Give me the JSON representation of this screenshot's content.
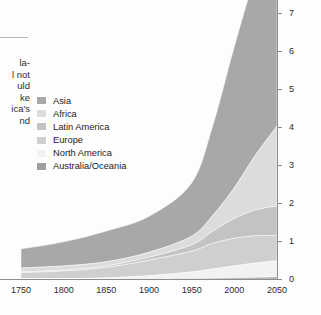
{
  "page": {
    "background": "#fdfdfd",
    "body_text_fragments": [
      "la-",
      "l not",
      "uld",
      "ke",
      "ica's",
      "nd"
    ]
  },
  "legend": {
    "items": [
      {
        "label": "Asia",
        "color": "#a8a8a8"
      },
      {
        "label": "Africa",
        "color": "#dcdcdc"
      },
      {
        "label": "Latin America",
        "color": "#c3c3c3"
      },
      {
        "label": "Europe",
        "color": "#cfcfcf"
      },
      {
        "label": "North America",
        "color": "#f2f2f2"
      },
      {
        "label": "Australia/Oceania",
        "color": "#9f9f9f"
      }
    ]
  },
  "axes": {
    "y_title": "Billions of people",
    "y_ticks": [
      "0",
      "1",
      "2",
      "3",
      "4",
      "5",
      "6",
      "7"
    ],
    "x_ticks": [
      "1750",
      "1800",
      "1850",
      "1900",
      "1950",
      "2000",
      "2050"
    ]
  },
  "chart_data": {
    "type": "area",
    "stacked": true,
    "title": "",
    "xlabel": "",
    "ylabel": "Billions of people",
    "xlim": [
      1750,
      2050
    ],
    "ylim": [
      0,
      7.6
    ],
    "grid": false,
    "legend_position": "inside-top-left",
    "x": [
      1750,
      1800,
      1850,
      1900,
      1950,
      1975,
      2000,
      2025,
      2050
    ],
    "series": [
      {
        "name": "Australia/Oceania",
        "color": "#9f9f9f",
        "values": [
          0.002,
          0.002,
          0.002,
          0.006,
          0.013,
          0.021,
          0.031,
          0.042,
          0.052
        ]
      },
      {
        "name": "North America",
        "color": "#f2f2f2",
        "values": [
          0.002,
          0.007,
          0.026,
          0.082,
          0.172,
          0.243,
          0.314,
          0.38,
          0.43
        ]
      },
      {
        "name": "Europe",
        "color": "#cfcfcf",
        "values": [
          0.163,
          0.203,
          0.276,
          0.408,
          0.547,
          0.676,
          0.727,
          0.715,
          0.66
        ]
      },
      {
        "name": "Latin America",
        "color": "#c3c3c3",
        "values": [
          0.016,
          0.024,
          0.038,
          0.074,
          0.167,
          0.322,
          0.521,
          0.68,
          0.78
        ]
      },
      {
        "name": "Africa",
        "color": "#dcdcdc",
        "values": [
          0.106,
          0.107,
          0.111,
          0.133,
          0.227,
          0.416,
          0.811,
          1.45,
          2.1
        ]
      },
      {
        "name": "Asia",
        "color": "#a8a8a8",
        "values": [
          0.502,
          0.635,
          0.809,
          0.947,
          1.402,
          2.379,
          3.714,
          4.72,
          5.27
        ]
      }
    ],
    "stack_totals": [
      0.791,
      0.978,
      1.262,
      1.65,
      2.528,
      4.057,
      6.118,
      7.987,
      9.292
    ],
    "top_of_visible_area_note": "Asia band is clipped by the top edge of the image above 7.6 billion"
  }
}
